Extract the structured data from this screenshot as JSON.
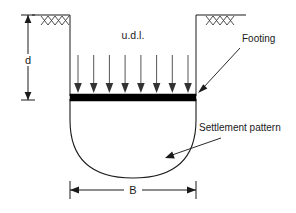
{
  "diagram": {
    "labels": {
      "udl": "u.d.l.",
      "depth": "d",
      "width": "B",
      "footing": "Footing",
      "settlement": "Settlement pattern"
    },
    "colors": {
      "line": "#1a1a1a",
      "footing_fill": "#000000",
      "hatch": "#3a3a3a",
      "load_arrow": "#555555",
      "background": "#ffffff"
    },
    "geometry": {
      "canvas_width": 296,
      "canvas_height": 213,
      "ground_line_y": 15,
      "ground_left_x1": 32,
      "ground_left_x2": 70,
      "ground_right_x1": 196,
      "ground_right_x2": 246,
      "excavation_left_x": 70,
      "excavation_right_x": 196,
      "excavation_bottom_y": 96,
      "footing_left_x": 70,
      "footing_right_x": 196,
      "footing_top_y": 94,
      "footing_bottom_y": 101,
      "bulb_bottom_y": 178,
      "bulb_straight_to_y": 120,
      "depth_dim_x": 28,
      "depth_dim_top_y": 15,
      "depth_dim_bottom_y": 100,
      "width_dim_y": 190,
      "load_arrow_count": 8,
      "load_arrow_top_y": 55,
      "load_arrow_tip_y": 93,
      "load_arrow_first_x": 78,
      "load_arrow_last_x": 188
    },
    "annotations": [
      {
        "name": "footing-callout",
        "text": "Footing",
        "text_x": 242,
        "text_y": 42,
        "leader_from_x": 240,
        "leader_from_y": 48,
        "leader_to_x": 199,
        "leader_to_y": 91
      },
      {
        "name": "settlement-callout",
        "text": "Settlement pattern",
        "text_x": 199,
        "text_y": 131,
        "leader_from_x": 221,
        "leader_from_y": 138,
        "leader_to_x": 166,
        "leader_to_y": 157
      }
    ],
    "hatch_marks": {
      "left": {
        "origin_x": 55,
        "origin_y": 16,
        "count": 5,
        "length": 11,
        "spread": 15
      },
      "right": {
        "origin_x": 220,
        "origin_y": 16,
        "count": 5,
        "length": 11,
        "spread": 15
      }
    }
  }
}
